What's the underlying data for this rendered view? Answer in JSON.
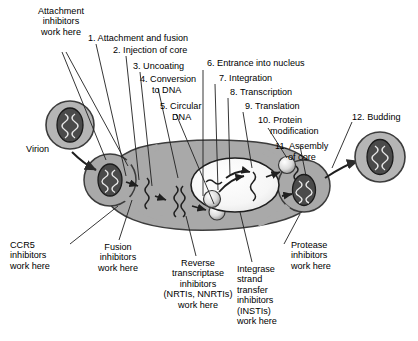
{
  "figure": {
    "background_color": "#ffffff",
    "cell_fill": "#a9a9a9",
    "cell_stroke": "#3c3c3c",
    "nucleus_fill": "#f2f2f2",
    "virion_fill": "#b5b5b5",
    "core_fill": "#4a4a4a",
    "text_color": "#000000"
  },
  "steps": [
    {
      "id": "step-1",
      "text": "1. Attachment and fusion"
    },
    {
      "id": "step-2",
      "text": "2. Injection of core"
    },
    {
      "id": "step-3",
      "text": "3. Uncoating"
    },
    {
      "id": "step-4a",
      "text": "4. Conversion"
    },
    {
      "id": "step-4b",
      "text": "to DNA"
    },
    {
      "id": "step-5a",
      "text": "5. Circular"
    },
    {
      "id": "step-5b",
      "text": "DNA"
    },
    {
      "id": "step-6",
      "text": "6. Entrance into nucleus"
    },
    {
      "id": "step-7",
      "text": "7. Integration"
    },
    {
      "id": "step-8",
      "text": "8. Transcription"
    },
    {
      "id": "step-9",
      "text": "9. Translation"
    },
    {
      "id": "step-10a",
      "text": "10. Protein"
    },
    {
      "id": "step-10b",
      "text": "modification"
    },
    {
      "id": "step-11a",
      "text": "11. Assembly"
    },
    {
      "id": "step-11b",
      "text": "of core"
    },
    {
      "id": "step-12",
      "text": "12. Budding"
    }
  ],
  "annotations": {
    "attachment_inhibitors": "Attachment\ninhibitors\nwork here",
    "virion": "Virion",
    "ccr5_inhibitors": "CCR5\ninhibitors\nwork here",
    "fusion_inhibitors": "Fusion\ninhibitors\nwork here",
    "reverse_transcriptase_inhibitors": "Reverse\ntranscriptase\ninhibitors\n(NRTIs, NNRTIs)\nwork here",
    "integrase_inhibitors": "Integrase\nstrand\ntransfer\ninhibitors\n(INSTIs)\nwork here",
    "protease_inhibitors": "Protease\ninhibitors\nwork here"
  }
}
